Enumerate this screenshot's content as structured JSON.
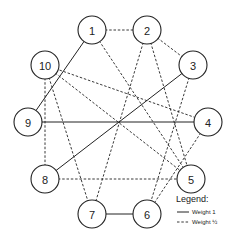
{
  "graph": {
    "nodes": [
      {
        "id": "1",
        "label": "1"
      },
      {
        "id": "2",
        "label": "2"
      },
      {
        "id": "3",
        "label": "3"
      },
      {
        "id": "4",
        "label": "4"
      },
      {
        "id": "5",
        "label": "5"
      },
      {
        "id": "6",
        "label": "6"
      },
      {
        "id": "7",
        "label": "7"
      },
      {
        "id": "8",
        "label": "8"
      },
      {
        "id": "9",
        "label": "9"
      },
      {
        "id": "10",
        "label": "10"
      }
    ],
    "edges": [
      {
        "from": "1",
        "to": "2",
        "weight": "1/2"
      },
      {
        "from": "1",
        "to": "9",
        "weight": "1"
      },
      {
        "from": "1",
        "to": "5",
        "weight": "1/2"
      },
      {
        "from": "2",
        "to": "3",
        "weight": "1/2"
      },
      {
        "from": "2",
        "to": "7",
        "weight": "1/2"
      },
      {
        "from": "2",
        "to": "5",
        "weight": "1/2"
      },
      {
        "from": "3",
        "to": "8",
        "weight": "1"
      },
      {
        "from": "3",
        "to": "6",
        "weight": "1/2"
      },
      {
        "from": "4",
        "to": "9",
        "weight": "1"
      },
      {
        "from": "4",
        "to": "10",
        "weight": "1/2"
      },
      {
        "from": "4",
        "to": "6",
        "weight": "1/2"
      },
      {
        "from": "10",
        "to": "5",
        "weight": "1/2"
      },
      {
        "from": "10",
        "to": "8",
        "weight": "1/2"
      },
      {
        "from": "10",
        "to": "7",
        "weight": "1/2"
      },
      {
        "from": "8",
        "to": "5",
        "weight": "1/2"
      },
      {
        "from": "7",
        "to": "6",
        "weight": "1"
      }
    ]
  },
  "legend": {
    "title": "Legend:",
    "items": [
      {
        "style": "solid",
        "label": "Weight 1"
      },
      {
        "style": "dashed",
        "label": "Weight ½"
      }
    ]
  }
}
